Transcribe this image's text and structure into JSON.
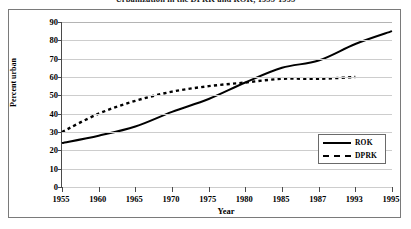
{
  "chart_data": {
    "type": "line",
    "title": "Urbanization in the DPRK and ROK, 1955-1995",
    "xlabel": "Year",
    "ylabel": "Percent urban",
    "categories": [
      "1955",
      "1960",
      "1965",
      "1970",
      "1975",
      "1980",
      "1985",
      "1987",
      "1993",
      "1995"
    ],
    "ylim": [
      0,
      90
    ],
    "yticks": [
      0,
      10,
      20,
      30,
      40,
      50,
      60,
      70,
      80,
      90
    ],
    "grid": true,
    "legend_position": "bottom-right",
    "series": [
      {
        "name": "ROK",
        "style": "solid",
        "color": "#000000",
        "values": [
          24,
          28,
          33,
          41,
          48,
          57,
          65,
          69,
          78,
          85
        ]
      },
      {
        "name": "DPRK",
        "style": "dashed",
        "color": "#000000",
        "values": [
          30,
          40,
          47,
          52,
          55,
          57,
          59,
          59,
          60,
          null
        ]
      }
    ]
  },
  "legend": {
    "items": [
      {
        "label": "ROK"
      },
      {
        "label": "DPRK"
      }
    ]
  }
}
